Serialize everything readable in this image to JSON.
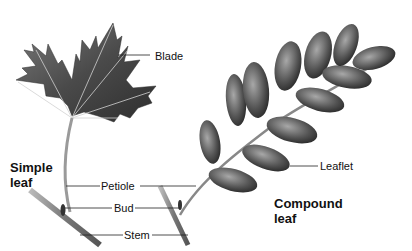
{
  "diagram": {
    "groups": [
      {
        "name": "Simple leaf",
        "line1": "Simple",
        "line2": "leaf"
      },
      {
        "name": "Compound leaf",
        "line1": "Compound",
        "line2": "leaf"
      }
    ],
    "labels": {
      "blade": "Blade",
      "petiole": "Petiole",
      "bud": "Bud",
      "stem": "Stem",
      "leaflet": "Leaflet"
    },
    "colors": {
      "leaf_dark": "#3a3a3a",
      "leaf_mid": "#6e6e6e",
      "leaf_light": "#9c9c9c",
      "vein": "#d8d8d8",
      "stem": "#8a8a8a",
      "leader_line": "#222222"
    }
  }
}
